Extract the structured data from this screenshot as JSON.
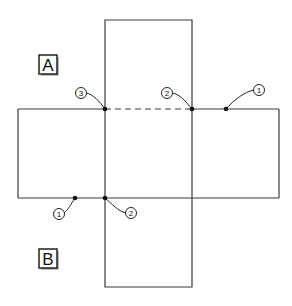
{
  "diagram": {
    "labels": [
      {
        "id": "A",
        "text": "A",
        "x": 48,
        "y": 64
      },
      {
        "id": "B",
        "text": "B",
        "x": 48,
        "y": 258
      }
    ],
    "shape": {
      "description": "cross-shaped net of five squares",
      "vertical_rect": {
        "x1": 105,
        "y1": 20,
        "x2": 192,
        "y2": 287
      },
      "horizontal_rect": {
        "x1": 18,
        "y1": 109,
        "x2": 279,
        "y2": 198
      },
      "dashed_edge": {
        "x1": 105,
        "y1": 109,
        "x2": 192,
        "y2": 109
      }
    },
    "callouts": [
      {
        "number": "1",
        "text": "1",
        "circle": {
          "cx": 259,
          "cy": 90
        },
        "point": {
          "x": 226,
          "y": 109
        }
      },
      {
        "number": "2",
        "text": "2",
        "circle": {
          "cx": 167,
          "cy": 93
        },
        "point": {
          "x": 192,
          "y": 109
        }
      },
      {
        "number": "3",
        "text": "3",
        "circle": {
          "cx": 81,
          "cy": 93
        },
        "point": {
          "x": 105,
          "y": 109
        }
      },
      {
        "number": "1",
        "text": "1",
        "circle": {
          "cx": 59,
          "cy": 214
        },
        "point": {
          "x": 75,
          "y": 198
        }
      },
      {
        "number": "2",
        "text": "2",
        "circle": {
          "cx": 131,
          "cy": 213
        },
        "point": {
          "x": 105,
          "y": 198
        }
      }
    ],
    "colors": {
      "line": "#3a3a3a",
      "background": "#ffffff",
      "text": "#111111"
    }
  }
}
